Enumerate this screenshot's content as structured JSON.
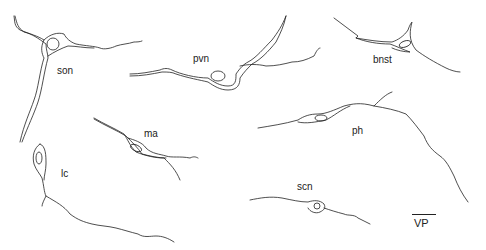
{
  "figure": {
    "type": "neuron camera-lucida drawings",
    "neurons": [
      {
        "id": "son",
        "label": "son",
        "label_pos": [
          56,
          67
        ]
      },
      {
        "id": "pvn",
        "label": "pvn",
        "label_pos": [
          193,
          55
        ]
      },
      {
        "id": "bnst",
        "label": "bnst",
        "label_pos": [
          373,
          56
        ]
      },
      {
        "id": "ma",
        "label": "ma",
        "label_pos": [
          144,
          130
        ]
      },
      {
        "id": "ph",
        "label": "ph",
        "label_pos": [
          352,
          127
        ]
      },
      {
        "id": "lc",
        "label": "lc",
        "label_pos": [
          61,
          170
        ]
      },
      {
        "id": "scn",
        "label": "scn",
        "label_pos": [
          298,
          183
        ]
      }
    ],
    "scale_label": "VP"
  }
}
